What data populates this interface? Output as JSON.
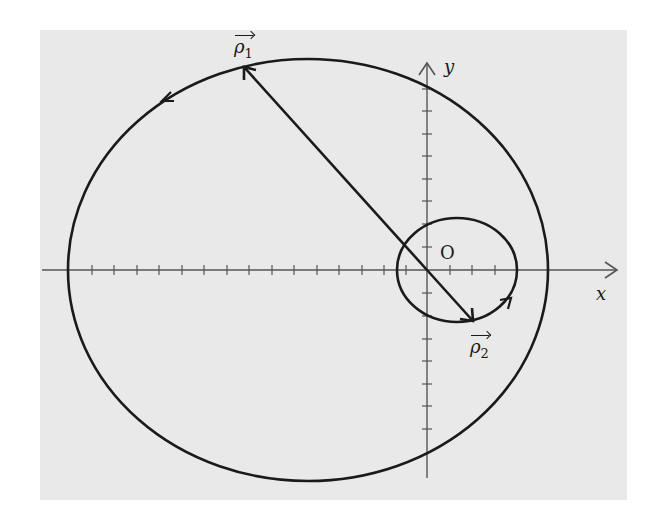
{
  "figure": {
    "background": "#e9e9e9",
    "stroke_color": "#1a1a1a",
    "axis_color": "#555555",
    "axes": {
      "x_label": "x",
      "y_label": "y",
      "origin_label": "O",
      "tick_spacing_px": 22.5
    },
    "circles": [
      {
        "name": "large-orbit",
        "center": [
          308,
          270
        ],
        "rx": 240,
        "ry": 211,
        "direction": "counter-clockwise"
      },
      {
        "name": "small-orbit",
        "center": [
          457,
          270
        ],
        "rx": 60,
        "ry": 52,
        "direction": "counter-clockwise"
      }
    ],
    "vectors": [
      {
        "name": "rho1",
        "symbol": "ρ",
        "subscript": "1",
        "from": [
          427,
          270
        ],
        "to": [
          243,
          66
        ]
      },
      {
        "name": "rho2",
        "symbol": "ρ",
        "subscript": "2",
        "from": [
          427,
          270
        ],
        "to": [
          473,
          322
        ]
      }
    ]
  }
}
